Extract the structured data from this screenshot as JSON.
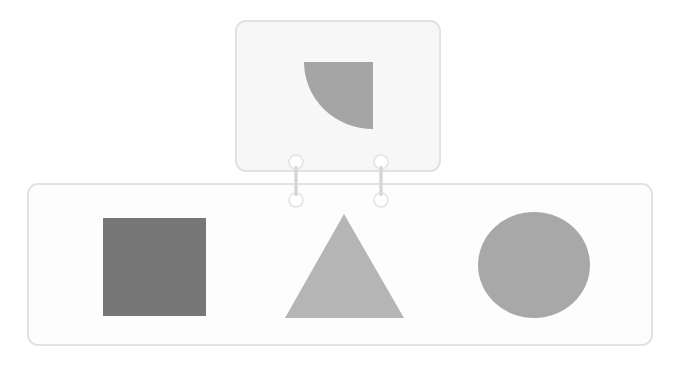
{
  "diagram": {
    "top_panel": {
      "shape": "quarter-circle",
      "color": "#a5a5a5"
    },
    "bottom_panel": {
      "shapes": [
        {
          "name": "square",
          "color": "#777777"
        },
        {
          "name": "triangle",
          "color": "#b5b5b5"
        },
        {
          "name": "circle",
          "color": "#a8a8a8"
        }
      ]
    },
    "connectors": [
      {
        "name": "left-connector"
      },
      {
        "name": "right-connector"
      }
    ],
    "colors": {
      "panel_border": "#e2e2e2",
      "connector": "#e0e0e0"
    }
  }
}
